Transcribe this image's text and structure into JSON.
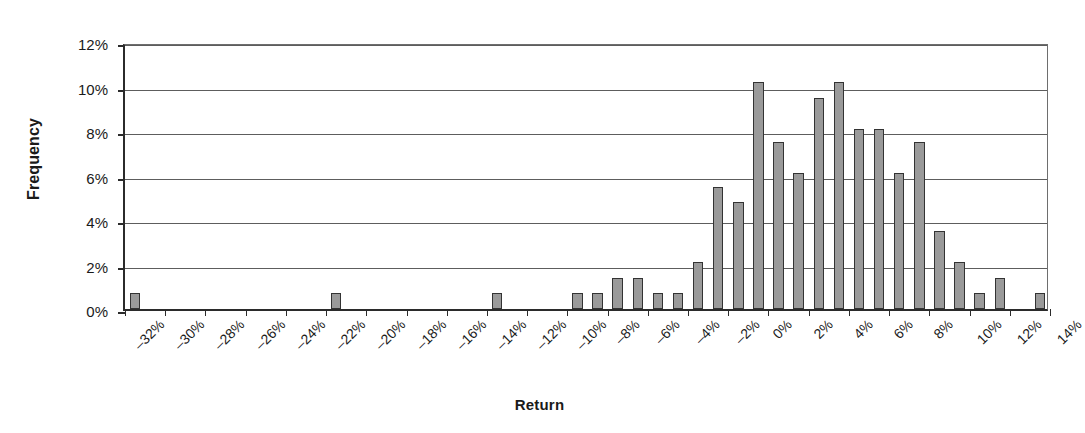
{
  "chart_data": {
    "type": "bar",
    "title": "",
    "xlabel": "Return",
    "ylabel": "Frequency",
    "ylim": [
      0,
      12
    ],
    "y_ticks": [
      "0%",
      "2%",
      "4%",
      "6%",
      "8%",
      "10%",
      "12%"
    ],
    "y_tick_values": [
      0,
      2,
      4,
      6,
      8,
      10,
      12
    ],
    "y_unit": "%",
    "grid": "horizontal",
    "legend": "none",
    "x_tick_labels": [
      "–32%",
      "–30%",
      "–28%",
      "–26%",
      "–24%",
      "–22%",
      "–20%",
      "–18%",
      "–16%",
      "–14%",
      "–12%",
      "–10%",
      "–8%",
      "–6%",
      "–4%",
      "–2%",
      "0%",
      "2%",
      "4%",
      "6%",
      "8%",
      "10%",
      "12%",
      "14%"
    ],
    "x_tick_values": [
      -32,
      -30,
      -28,
      -26,
      -24,
      -22,
      -20,
      -18,
      -16,
      -14,
      -12,
      -10,
      -8,
      -6,
      -4,
      -2,
      0,
      2,
      4,
      6,
      8,
      10,
      12,
      14
    ],
    "bin_width": 1,
    "x_range": [
      -32,
      14
    ],
    "bin_starts": [
      -32,
      -31,
      -30,
      -29,
      -28,
      -27,
      -26,
      -25,
      -24,
      -23,
      -22,
      -21,
      -20,
      -19,
      -18,
      -17,
      -16,
      -15,
      -14,
      -13,
      -12,
      -11,
      -10,
      -9,
      -8,
      -7,
      -6,
      -5,
      -4,
      -3,
      -2,
      -1,
      0,
      1,
      2,
      3,
      4,
      5,
      6,
      7,
      8,
      9,
      10,
      11,
      12,
      13
    ],
    "values": [
      0.7,
      0,
      0,
      0,
      0,
      0,
      0,
      0,
      0,
      0,
      0.7,
      0,
      0,
      0,
      0,
      0,
      0,
      0,
      0.7,
      0,
      0,
      0,
      0.7,
      0.7,
      1.4,
      1.4,
      0.7,
      0.7,
      2.1,
      5.5,
      4.8,
      10.2,
      7.5,
      6.1,
      9.5,
      10.2,
      8.1,
      8.1,
      6.1,
      7.5,
      3.5,
      2.1,
      0.7,
      1.4,
      0,
      0.7
    ],
    "bar_color": "#9a9a9a",
    "bar_edge_color": "#333333",
    "axis_color": "#2b2b2b",
    "gridline_color": "#5d5d5d",
    "background": "#ffffff"
  }
}
